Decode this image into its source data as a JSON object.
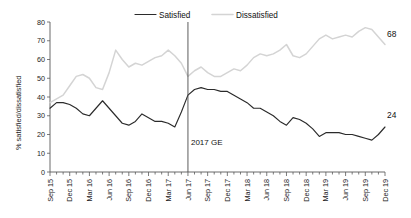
{
  "chart_data": {
    "type": "line",
    "title": "",
    "xlabel": "",
    "ylabel": "% satisfied/dissatisfied",
    "ylim": [
      0,
      80
    ],
    "ytick_step": 10,
    "yticks": [
      0,
      10,
      20,
      30,
      40,
      50,
      60,
      70,
      80
    ],
    "grid": false,
    "legend_position": "top-center",
    "x": [
      "Sep 15",
      "Oct 15",
      "Nov 15",
      "Dec 15",
      "Jan 16",
      "Feb 16",
      "Mar 16",
      "Apr 16",
      "May 16",
      "Jun 16",
      "Jul 16",
      "Aug 16",
      "Sep 16",
      "Oct 16",
      "Nov 16",
      "Dec 16",
      "Jan 17",
      "Feb 17",
      "Mar 17",
      "Apr 17",
      "May 17",
      "Jun 17",
      "Jul 17",
      "Aug 17",
      "Sep 17",
      "Oct 17",
      "Nov 17",
      "Dec 17",
      "Jan 18",
      "Feb 18",
      "Mar 18",
      "Apr 18",
      "May 18",
      "Jun 18",
      "Jul 18",
      "Aug 18",
      "Sep 18",
      "Oct 18",
      "Nov 18",
      "Dec 18",
      "Jan 19",
      "Feb 19",
      "Mar 19",
      "Apr 19",
      "May 19",
      "Jun 19",
      "Jul 19",
      "Aug 19",
      "Sep 19",
      "Oct 19",
      "Nov 19",
      "Dec 19"
    ],
    "xtick_labels": [
      "Sep 15",
      "Dec 15",
      "Mar 16",
      "Jun 16",
      "Sep 16",
      "Dec 16",
      "Mar 17",
      "Jun 17",
      "Sep 17",
      "Dec 17",
      "Mar 18",
      "Jun 18",
      "Sep 18",
      "Dec 18",
      "Mar 19",
      "Jun 19",
      "Sep 19",
      "Dec 19"
    ],
    "series": [
      {
        "name": "Satisfied",
        "color": "#2b2b2b",
        "end_label": "24",
        "values": [
          34,
          37,
          37,
          36,
          34,
          31,
          30,
          34,
          38,
          34,
          30,
          26,
          25,
          27,
          31,
          29,
          27,
          27,
          26,
          24,
          32,
          41,
          44,
          45,
          44,
          44,
          43,
          43,
          41,
          39,
          37,
          34,
          34,
          32,
          30,
          27,
          25,
          29,
          28,
          26,
          23,
          19,
          21,
          21,
          21,
          20,
          20,
          19,
          18,
          17,
          20,
          24
        ]
      },
      {
        "name": "Dissatisfied",
        "color": "#d4d4d4",
        "end_label": "68",
        "values": [
          37,
          39,
          41,
          46,
          51,
          52,
          50,
          45,
          44,
          53,
          65,
          60,
          56,
          58,
          57,
          59,
          61,
          62,
          65,
          62,
          58,
          51,
          54,
          56,
          53,
          51,
          51,
          53,
          55,
          54,
          57,
          61,
          63,
          62,
          63,
          65,
          68,
          62,
          61,
          63,
          67,
          71,
          73,
          71,
          72,
          73,
          72,
          75,
          77,
          76,
          72,
          68
        ]
      }
    ],
    "annotations": [
      {
        "label": "2017 GE",
        "x": "Jun 17",
        "type": "vertical-line"
      }
    ]
  },
  "legend": {
    "items": [
      {
        "label": "Satisfied"
      },
      {
        "label": "Dissatisfied"
      }
    ]
  },
  "axes": {
    "y_title": "% satisfied/dissatisfied"
  }
}
